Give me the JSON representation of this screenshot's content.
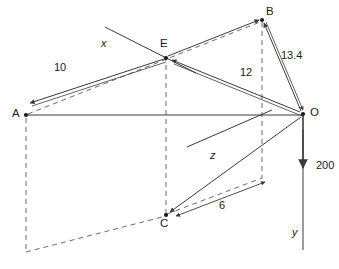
{
  "diagram": {
    "background_color": "#ffffff",
    "line_color": "#3a3a3a",
    "text_color": "#1a1a1a",
    "points": [
      {
        "id": "A",
        "label": "A",
        "x": 25,
        "y": 115,
        "label_x": 12,
        "label_y": 108
      },
      {
        "id": "B",
        "label": "B",
        "x": 262,
        "y": 19,
        "label_x": 266,
        "label_y": 6
      },
      {
        "id": "C",
        "label": "C",
        "x": 166,
        "y": 215,
        "label_x": 160,
        "label_y": 218
      },
      {
        "id": "E",
        "label": "E",
        "x": 166,
        "y": 58,
        "label_x": 160,
        "label_y": 38
      },
      {
        "id": "O",
        "label": "O",
        "x": 303,
        "y": 114,
        "label_x": 310,
        "label_y": 107
      }
    ],
    "axes": [
      {
        "id": "x",
        "label": "x",
        "label_x": 101,
        "label_y": 38
      },
      {
        "id": "y",
        "label": "y",
        "label_x": 292,
        "label_y": 227
      },
      {
        "id": "z",
        "label": "z",
        "label_x": 210,
        "label_y": 150
      }
    ],
    "dimensions": [
      {
        "id": "ae",
        "label": "10",
        "label_x": 54,
        "label_y": 62,
        "from": "E",
        "to": "A"
      },
      {
        "id": "eo",
        "label": "12",
        "label_x": 240,
        "label_y": 67,
        "from": "O",
        "to": "E"
      },
      {
        "id": "bo",
        "label": "13.4",
        "label_x": 281,
        "label_y": 50,
        "from": "B",
        "to": "O"
      },
      {
        "id": "co",
        "label": "6",
        "label_x": 219,
        "label_y": 200,
        "from": "dim-right",
        "to": "C"
      },
      {
        "id": "force",
        "label": "200",
        "label_x": 316,
        "label_y": 160,
        "from": "O",
        "to": "down"
      }
    ]
  }
}
